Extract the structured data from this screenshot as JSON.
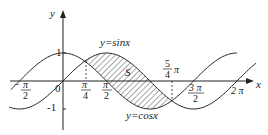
{
  "diagram": {
    "axes": {
      "x_label": "x",
      "y_label": "y",
      "origin_label": "0",
      "y_ticks": [
        {
          "value": 1,
          "label": "1"
        },
        {
          "value": -1,
          "label": "-1"
        }
      ],
      "x_ticks": [
        {
          "value": "-π/2",
          "num": "π",
          "den": "2",
          "sign": "−"
        },
        {
          "value": "π/4",
          "num": "π",
          "den": "4"
        },
        {
          "value": "π/2",
          "num": "π",
          "den": "2"
        },
        {
          "value": "5π/4",
          "num": "5",
          "den": "4",
          "suffix": "π"
        },
        {
          "value": "3π/2",
          "num": "3 π",
          "den": "2"
        },
        {
          "value": "2π",
          "label": "2 π"
        }
      ]
    },
    "curves": [
      {
        "name": "sin",
        "label": "y=sinx"
      },
      {
        "name": "cos",
        "label": "y=cosx"
      }
    ],
    "region": {
      "label": "S",
      "from": "π/4",
      "to": "5π/4",
      "fill": "hatched"
    },
    "colors": {
      "stroke": "#222222",
      "background": "#ffffff"
    }
  }
}
